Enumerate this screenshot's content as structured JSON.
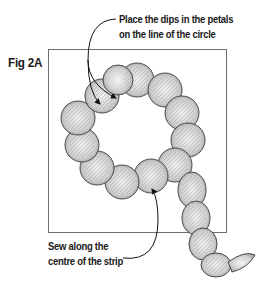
{
  "figure": {
    "label": "Fig 2A"
  },
  "annotations": {
    "top_line1": "Place the dips in the petals",
    "top_line2": "on the line of the circle",
    "bottom_line1": "Sew along the",
    "bottom_line2": "centre of the strip"
  },
  "colors": {
    "frame": "#6e6e6e",
    "petal_stroke": "#3a3a3a",
    "petal_fill": "#d9d9d9",
    "text": "#1a1a1a"
  }
}
